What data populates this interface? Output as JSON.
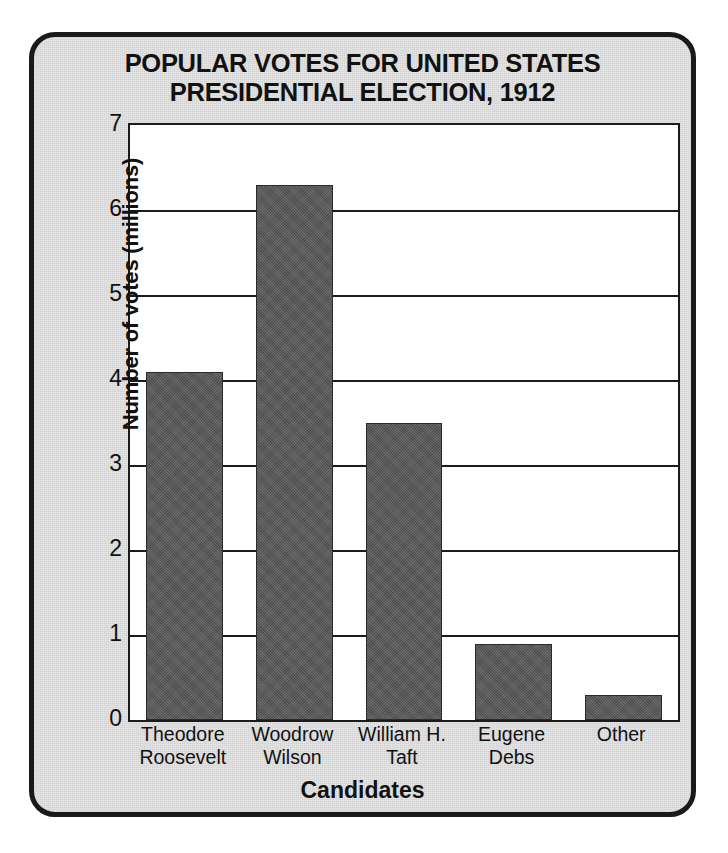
{
  "chart_data": {
    "type": "bar",
    "title": "POPULAR VOTES FOR UNITED STATES PRESIDENTIAL ELECTION, 1912",
    "title_lines": [
      "POPULAR VOTES FOR UNITED STATES",
      "PRESIDENTIAL ELECTION, 1912"
    ],
    "xlabel": "Candidates",
    "ylabel": "Number of votes (millions)",
    "categories": [
      "Theodore Roosevelt",
      "Woodrow Wilson",
      "William H. Taft",
      "Eugene Debs",
      "Other"
    ],
    "category_lines": [
      [
        "Theodore",
        "Roosevelt"
      ],
      [
        "Woodrow",
        "Wilson"
      ],
      [
        "William H.",
        "Taft"
      ],
      [
        "Eugene",
        "Debs"
      ],
      [
        "Other"
      ]
    ],
    "values": [
      4.1,
      6.3,
      3.5,
      0.9,
      0.3
    ],
    "ylim": [
      0,
      7
    ],
    "ytick_values": [
      0,
      1,
      2,
      3,
      4,
      5,
      6,
      7
    ],
    "ytick_labels": [
      "0",
      "1",
      "2",
      "3",
      "4",
      "5",
      "6",
      "7"
    ],
    "grid": true,
    "grid_axis": "y",
    "legend": false,
    "bar_color": "#585858",
    "plot_background": "#ffffff",
    "panel_background": "#e4e4e4",
    "frame_color": "#1a1a1a"
  }
}
